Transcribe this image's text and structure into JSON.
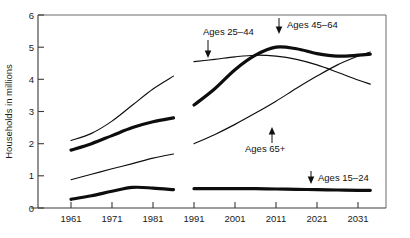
{
  "chart_data": {
    "type": "line",
    "title": "",
    "xlabel": "",
    "ylabel": "Households in millions",
    "xlim": [
      1959,
      2035
    ],
    "ylim": [
      0,
      6
    ],
    "grid": false,
    "legend": "annotations-on-plot",
    "x_ticks": [
      "1961",
      "1971",
      "1981",
      "1991",
      "2001",
      "2011",
      "2021",
      "2031"
    ],
    "y_ticks": [
      "0",
      "1",
      "2",
      "3",
      "4",
      "5",
      "6"
    ],
    "note": "Left segment is historical (1961-1986); right segment is projected (1991-2034); a gap separates them.",
    "series": [
      {
        "name": "Ages 25-44",
        "style": "thin",
        "label": "Ages 25–44",
        "arrow": "down",
        "segments": [
          {
            "period": "historical",
            "x": [
              1961,
              1966,
              1971,
              1976,
              1981,
              1986
            ],
            "values": [
              2.1,
              2.32,
              2.7,
              3.2,
              3.7,
              4.1
            ]
          },
          {
            "period": "projected",
            "x": [
              1991,
              1996,
              2001,
              2006,
              2011,
              2016,
              2021,
              2026,
              2031,
              2034
            ],
            "values": [
              4.55,
              4.62,
              4.7,
              4.75,
              4.72,
              4.62,
              4.45,
              4.22,
              3.98,
              3.85
            ]
          }
        ]
      },
      {
        "name": "Ages 45-64",
        "style": "thick",
        "label": "Ages 45–64",
        "arrow": "down",
        "segments": [
          {
            "period": "historical",
            "x": [
              1961,
              1966,
              1971,
              1976,
              1981,
              1986
            ],
            "values": [
              1.8,
              2.0,
              2.25,
              2.5,
              2.68,
              2.8
            ]
          },
          {
            "period": "projected",
            "x": [
              1991,
              1996,
              2001,
              2006,
              2011,
              2016,
              2021,
              2026,
              2031,
              2034
            ],
            "values": [
              3.2,
              3.7,
              4.3,
              4.75,
              5.0,
              4.95,
              4.8,
              4.72,
              4.75,
              4.78
            ]
          }
        ]
      },
      {
        "name": "Ages 65+",
        "style": "thin",
        "label": "Ages 65+",
        "arrow": "up",
        "segments": [
          {
            "period": "historical",
            "x": [
              1961,
              1966,
              1971,
              1976,
              1981,
              1986
            ],
            "values": [
              0.88,
              1.05,
              1.22,
              1.38,
              1.55,
              1.68
            ]
          },
          {
            "period": "projected",
            "x": [
              1991,
              1996,
              2001,
              2006,
              2011,
              2016,
              2021,
              2026,
              2031,
              2034
            ],
            "values": [
              2.0,
              2.28,
              2.6,
              2.95,
              3.32,
              3.72,
              4.1,
              4.45,
              4.72,
              4.85
            ]
          }
        ]
      },
      {
        "name": "Ages 15-24",
        "style": "thick",
        "label": "Ages 15–24",
        "arrow": "down",
        "segments": [
          {
            "period": "historical",
            "x": [
              1961,
              1966,
              1971,
              1976,
              1981,
              1986
            ],
            "values": [
              0.27,
              0.38,
              0.52,
              0.64,
              0.62,
              0.57
            ]
          },
          {
            "period": "projected",
            "x": [
              1991,
              1996,
              2001,
              2006,
              2011,
              2016,
              2021,
              2026,
              2031,
              2034
            ],
            "values": [
              0.6,
              0.6,
              0.6,
              0.6,
              0.59,
              0.58,
              0.57,
              0.56,
              0.55,
              0.55
            ]
          }
        ]
      }
    ],
    "annotations": [
      {
        "name": "annotation-ages-25-44",
        "text": "Ages 25–44",
        "arrow": "down"
      },
      {
        "name": "annotation-ages-45-64",
        "text": "Ages 45–64",
        "arrow": "down"
      },
      {
        "name": "annotation-ages-65-plus",
        "text": "Ages 65+",
        "arrow": "up"
      },
      {
        "name": "annotation-ages-15-24",
        "text": "Ages 15–24",
        "arrow": "down"
      }
    ]
  }
}
